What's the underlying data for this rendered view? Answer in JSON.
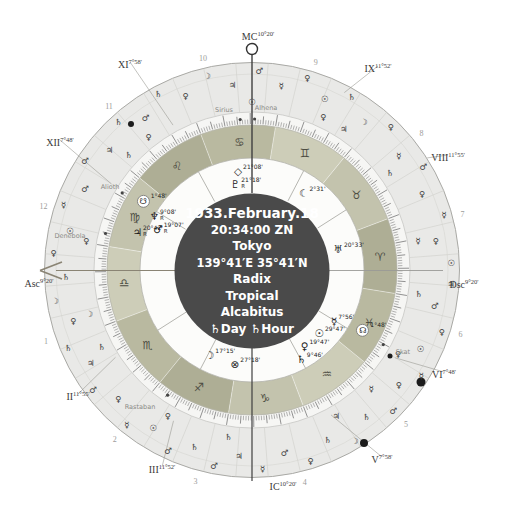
{
  "colors": {
    "center_bg": "#4a4a4a",
    "band": "#e9e9e7",
    "tick_band": "#f6f6f4",
    "inner": "#fcfcfa",
    "ring_fire": "#aeae95",
    "ring_earth": "#c3c3ad",
    "ring_air": "#cdcdb8",
    "ring_water": "#b9b9a0",
    "axis_line": "#3f3f3f",
    "asc_arrow": "#8a8474"
  },
  "center": {
    "date": "1933.February.18",
    "time": "20:34:00 ZN",
    "city": "Tokyo",
    "coords": "139°41′E 35°41′N",
    "chart_type": "Radix",
    "zodiac": "Tropical",
    "house_system": "Alcabitus",
    "ruler_line": "♄Day ♄Hour"
  },
  "chart_data": {
    "type": "other",
    "subtype": "astrology-natal-wheel",
    "angles": {
      "mc": {
        "name": "MC",
        "deg": "10°20'",
        "x": 258,
        "y": 36
      },
      "ic": {
        "name": "IC",
        "deg": "10°20'",
        "x": 283,
        "y": 486
      },
      "asc": {
        "name": "Asc",
        "deg": "9°20'",
        "x": 39,
        "y": 283
      },
      "dsc": {
        "name": "Dsc",
        "deg": "9°20'",
        "x": 464,
        "y": 284
      }
    },
    "cusps": [
      {
        "numeral": "XI",
        "deg": "7°58'",
        "a": 118.6,
        "lx": 130,
        "ly": 64,
        "lr": 165
      },
      {
        "numeral": "XII",
        "deg": "7°48'",
        "a": 148.5,
        "lx": 60,
        "ly": 142,
        "lr": 165
      },
      {
        "numeral": "II",
        "deg": "11°55'",
        "a": 212.6,
        "lx": 78,
        "ly": 396,
        "lr": 162
      },
      {
        "numeral": "III",
        "deg": "11°52'",
        "a": 242.5,
        "lx": 162,
        "ly": 469,
        "lr": 170
      },
      {
        "numeral": "V",
        "deg": "7°58'",
        "a": 298.6,
        "lx": 382,
        "ly": 459,
        "lr": 165
      },
      {
        "numeral": "VI",
        "deg": "7°48'",
        "a": 328.5,
        "lx": 444,
        "ly": 374,
        "lr": 168
      },
      {
        "numeral": "VIII",
        "deg": "11°55'",
        "a": 32.6,
        "lx": 448,
        "ly": 157,
        "lr": 208
      },
      {
        "numeral": "IX",
        "deg": "11°52'",
        "a": 62.5,
        "lx": 378,
        "ly": 68,
        "lr": 200
      }
    ],
    "house_numbers": [
      {
        "n": "1",
        "a": 199
      },
      {
        "n": "2",
        "a": 231
      },
      {
        "n": "3",
        "a": 255
      },
      {
        "n": "4",
        "a": 284
      },
      {
        "n": "5",
        "a": 315
      },
      {
        "n": "6",
        "a": 343
      },
      {
        "n": "7",
        "a": 15
      },
      {
        "n": "8",
        "a": 39
      },
      {
        "n": "9",
        "a": 73
      },
      {
        "n": "10",
        "a": 103
      },
      {
        "n": "11",
        "a": 131
      },
      {
        "n": "12",
        "a": 163
      }
    ],
    "signs": [
      {
        "name": "aries",
        "glyph": "♈",
        "start": 350.67,
        "element": "fire"
      },
      {
        "name": "taurus",
        "glyph": "♉",
        "start": 20.67,
        "element": "earth"
      },
      {
        "name": "gemini",
        "glyph": "♊",
        "start": 50.67,
        "element": "air"
      },
      {
        "name": "cancer",
        "glyph": "♋",
        "start": 80.67,
        "element": "water"
      },
      {
        "name": "leo",
        "glyph": "♌",
        "start": 110.67,
        "element": "fire"
      },
      {
        "name": "virgo",
        "glyph": "♍",
        "start": 140.67,
        "element": "earth"
      },
      {
        "name": "libra",
        "glyph": "♎",
        "start": 170.67,
        "element": "air"
      },
      {
        "name": "scorpio",
        "glyph": "♏",
        "start": 200.67,
        "element": "water"
      },
      {
        "name": "sagittarius",
        "glyph": "♐",
        "start": 230.67,
        "element": "fire"
      },
      {
        "name": "capricorn",
        "glyph": "♑",
        "start": 260.67,
        "element": "earth"
      },
      {
        "name": "aquarius",
        "glyph": "♒",
        "start": 290.67,
        "element": "air"
      },
      {
        "name": "pisces",
        "glyph": "♓",
        "start": 320.67,
        "element": "water"
      }
    ],
    "planets": [
      {
        "name": "pluto",
        "glyph": "♇",
        "deg": "21°18'",
        "retro": true,
        "a": 94,
        "r": 86
      },
      {
        "name": "point-diamond",
        "glyph": "◇",
        "deg": "21°08'",
        "retro": false,
        "a": 92,
        "r": 99
      },
      {
        "name": "lilith",
        "glyph": "☾",
        "deg": "2°31'",
        "retro": false,
        "a": 52,
        "r": 98
      },
      {
        "name": "uranus",
        "glyph": "♅",
        "deg": "20°33'",
        "retro": false,
        "a": 12.5,
        "r": 99
      },
      {
        "name": "north-node",
        "glyph": "☊",
        "deg": "1°48'",
        "retro": false,
        "a": 333,
        "r": 134,
        "disc": true
      },
      {
        "name": "mercury",
        "glyph": "☿",
        "deg": "7°56'",
        "retro": false,
        "a": 330.5,
        "r": 104
      },
      {
        "name": "sun",
        "glyph": "☉",
        "deg": "29°47'",
        "retro": false,
        "a": 321,
        "r": 100
      },
      {
        "name": "venus",
        "glyph": "♀",
        "deg": "19°47'",
        "retro": false,
        "a": 309.5,
        "r": 99
      },
      {
        "name": "saturn",
        "glyph": "♄",
        "deg": "9°46'",
        "retro": false,
        "a": 303,
        "r": 106
      },
      {
        "name": "part-of-fortune",
        "glyph": "⊗",
        "deg": "27°18'",
        "retro": false,
        "a": 266,
        "r": 94
      },
      {
        "name": "moon",
        "glyph": "☽",
        "deg": "17°15'",
        "retro": false,
        "a": 249.5,
        "r": 91
      },
      {
        "name": "south-node",
        "glyph": "☋",
        "deg": "1°48'",
        "retro": false,
        "a": 146,
        "r": 121,
        "disc": true
      },
      {
        "name": "neptune",
        "glyph": "♆",
        "deg": "9°08'",
        "retro": true,
        "a": 149,
        "r": 104
      },
      {
        "name": "jupiter",
        "glyph": "♃",
        "deg": "20°42'",
        "retro": true,
        "a": 160,
        "r": 111
      },
      {
        "name": "mars",
        "glyph": "♂",
        "deg": "19°07'",
        "retro": true,
        "a": 154,
        "r": 93
      }
    ],
    "stars": [
      {
        "name": "Sirius",
        "a": 94.5,
        "lx": 224,
        "ly": 110
      },
      {
        "name": "Alhena",
        "a": 89,
        "lx": 266,
        "ly": 108
      },
      {
        "name": "Alioth",
        "a": 149.3,
        "lx": 110,
        "ly": 187
      },
      {
        "name": "Denebola",
        "a": 166,
        "lx": 70,
        "ly": 236
      },
      {
        "name": "Rastaban",
        "a": 236,
        "lx": 140,
        "ly": 407
      },
      {
        "name": "Skat",
        "a": 330.4,
        "lx": 403,
        "ly": 352
      }
    ],
    "black_dots": [
      {
        "x": 131,
        "y": 124,
        "d": 6
      },
      {
        "x": 421,
        "y": 382,
        "d": 9
      },
      {
        "x": 364,
        "y": 443,
        "d": 8
      },
      {
        "x": 390,
        "y": 356,
        "d": 5
      }
    ],
    "outer_glyphs": [
      [
        2,
        0,
        "☉"
      ],
      [
        9,
        1,
        "♀"
      ],
      [
        16,
        0,
        "☿"
      ],
      [
        24,
        1,
        "♀"
      ],
      [
        31,
        0,
        "♂"
      ],
      [
        38,
        1,
        "☿"
      ],
      [
        46,
        0,
        "♀"
      ],
      [
        53,
        1,
        "☽"
      ],
      [
        60,
        0,
        "♄"
      ],
      [
        67,
        1,
        "☉"
      ],
      [
        74,
        0,
        "♀"
      ],
      [
        81,
        1,
        "☿"
      ],
      [
        88,
        0,
        "♂"
      ],
      [
        96,
        1,
        "♃"
      ],
      [
        103,
        0,
        "☽"
      ],
      [
        111,
        1,
        "♀"
      ],
      [
        118,
        0,
        "♄"
      ],
      [
        125,
        1,
        "♂"
      ],
      [
        132,
        0,
        "♄"
      ],
      [
        140,
        1,
        "♃"
      ],
      [
        147,
        0,
        "♂"
      ],
      [
        154,
        1,
        "♂"
      ],
      [
        161,
        0,
        "☿"
      ],
      [
        168,
        1,
        "☉"
      ],
      [
        175,
        0,
        "♀"
      ],
      [
        182,
        1,
        "♄"
      ],
      [
        189,
        0,
        "☽"
      ],
      [
        196,
        1,
        "♀"
      ],
      [
        203,
        0,
        "♄"
      ],
      [
        210,
        1,
        "♃"
      ],
      [
        217,
        0,
        "♂"
      ],
      [
        224,
        1,
        "♀"
      ],
      [
        231,
        0,
        "☿"
      ],
      [
        238,
        1,
        "☉"
      ],
      [
        245,
        0,
        "♂"
      ],
      [
        252,
        1,
        "♄"
      ],
      [
        259,
        0,
        "♂"
      ],
      [
        266,
        1,
        "♃"
      ],
      [
        273,
        0,
        "☿"
      ],
      [
        280,
        1,
        "♂"
      ],
      [
        287,
        0,
        "♀"
      ],
      [
        294,
        1,
        "♄"
      ],
      [
        301,
        0,
        "☽"
      ],
      [
        308,
        1,
        "♄"
      ],
      [
        315,
        0,
        "♂"
      ],
      [
        322,
        1,
        "♀"
      ],
      [
        328,
        0,
        "☿"
      ],
      [
        335,
        1,
        "☉"
      ],
      [
        342,
        0,
        "♀"
      ],
      [
        349,
        1,
        "♂"
      ],
      [
        356,
        0,
        "♃"
      ],
      [
        10,
        2,
        "☿"
      ],
      [
        35,
        2,
        "♄"
      ],
      [
        57,
        2,
        "♃"
      ],
      [
        65,
        2,
        "♀"
      ],
      [
        90,
        2,
        "☉"
      ],
      [
        128,
        2,
        "♀"
      ],
      [
        137,
        2,
        "♄"
      ],
      [
        170,
        2,
        "♀"
      ],
      [
        195,
        2,
        "☽"
      ],
      [
        207,
        2,
        "♄"
      ],
      [
        240,
        2,
        "♀"
      ],
      [
        262,
        2,
        "♄"
      ],
      [
        300,
        2,
        "♃"
      ],
      [
        315,
        2,
        "☿"
      ],
      [
        330,
        2,
        "♀"
      ],
      [
        352,
        2,
        "♄"
      ]
    ]
  }
}
